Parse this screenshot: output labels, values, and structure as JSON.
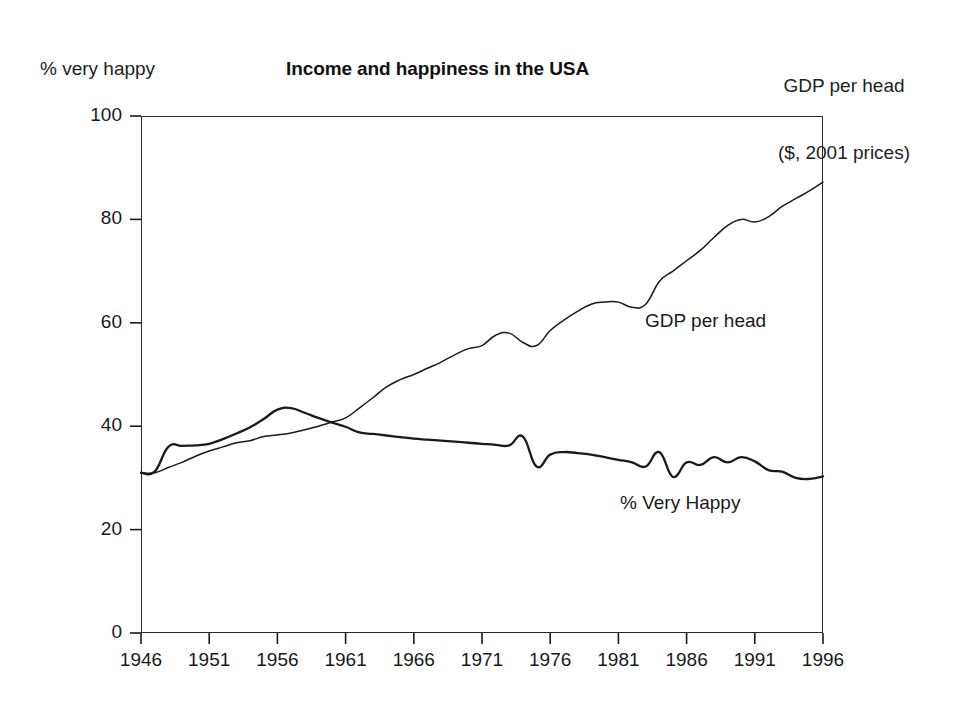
{
  "figure": {
    "title": "Income and happiness in the USA",
    "left_axis_label": "% very happy",
    "right_axis_label_line1": "GDP per head",
    "right_axis_label_line2": "($, 2001 prices)",
    "background_color": "#ffffff",
    "line_color": "#1a1a1a"
  },
  "chart_data": {
    "type": "line",
    "title": "Income and happiness in the USA",
    "subtitle": "",
    "xlabel": "",
    "ylabel": "% very happy",
    "y2label": "GDP per head ($, 2001 prices)",
    "xlim": [
      1946,
      1996
    ],
    "ylim": [
      0,
      100
    ],
    "yticks": [
      0,
      20,
      40,
      60,
      80,
      100
    ],
    "ytick_labels": [
      "0",
      "20",
      "40",
      "60",
      "80",
      "100"
    ],
    "xticks": [
      1946,
      1951,
      1956,
      1961,
      1966,
      1971,
      1976,
      1981,
      1986,
      1991,
      1996
    ],
    "xtick_labels": [
      "1946",
      "1951",
      "1956",
      "1961",
      "1966",
      "1971",
      "1976",
      "1981",
      "1986",
      "1991",
      "1996"
    ],
    "grid": false,
    "legend": "inline-annotations",
    "annotations": [
      {
        "text": "GDP per head",
        "x": 1985,
        "y": 61
      },
      {
        "text": "% Very Happy",
        "x": 1983,
        "y": 25
      }
    ],
    "x": [
      1946,
      1947,
      1948,
      1949,
      1950,
      1951,
      1952,
      1953,
      1954,
      1955,
      1956,
      1957,
      1958,
      1959,
      1960,
      1961,
      1962,
      1963,
      1964,
      1965,
      1966,
      1967,
      1968,
      1969,
      1970,
      1971,
      1972,
      1973,
      1974,
      1975,
      1976,
      1977,
      1978,
      1979,
      1980,
      1981,
      1982,
      1983,
      1984,
      1985,
      1986,
      1987,
      1988,
      1989,
      1990,
      1991,
      1992,
      1993,
      1994,
      1995,
      1996
    ],
    "series": [
      {
        "name": "% Very Happy",
        "style": "thick",
        "values": [
          31.0,
          31.2,
          36.0,
          36.2,
          36.3,
          36.6,
          37.5,
          38.6,
          39.8,
          41.4,
          43.2,
          43.5,
          42.6,
          41.6,
          40.7,
          39.9,
          38.8,
          38.5,
          38.2,
          37.9,
          37.6,
          37.4,
          37.2,
          37.0,
          36.8,
          36.6,
          36.4,
          36.3,
          38.0,
          32.2,
          34.5,
          35.0,
          34.8,
          34.5,
          34.0,
          33.5,
          33.0,
          32.2,
          35.0,
          30.2,
          33.0,
          32.5,
          34.0,
          33.0,
          34.0,
          33.2,
          31.5,
          31.2,
          30.0,
          29.8,
          30.3
        ]
      },
      {
        "name": "GDP per head",
        "style": "thin",
        "values": [
          31.0,
          31.0,
          32.0,
          33.0,
          34.2,
          35.2,
          36.0,
          36.8,
          37.2,
          38.0,
          38.3,
          38.7,
          39.3,
          40.0,
          40.8,
          41.6,
          43.5,
          45.5,
          47.6,
          49.0,
          50.0,
          51.2,
          52.4,
          53.8,
          55.0,
          55.6,
          57.6,
          58.0,
          56.2,
          55.6,
          58.5,
          60.5,
          62.2,
          63.6,
          64.0,
          64.0,
          63.0,
          63.6,
          68.0,
          70.0,
          72.0,
          74.0,
          76.5,
          78.8,
          80.0,
          79.5,
          80.5,
          82.5,
          84.0,
          85.5,
          87.2
        ]
      }
    ]
  }
}
